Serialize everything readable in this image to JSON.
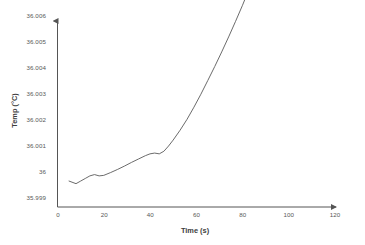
{
  "chart_data": {
    "type": "line",
    "title": "",
    "xlabel": "Time (s)",
    "ylabel": "Temp (°C)",
    "xlim": [
      0,
      120
    ],
    "ylim": [
      35.999,
      36.006
    ],
    "grid": false,
    "legend": null,
    "xticks": [
      "0",
      "20",
      "40",
      "60",
      "80",
      "100",
      "120"
    ],
    "xtick_values": [
      0,
      20,
      40,
      60,
      80,
      100,
      120
    ],
    "yticks": [
      "35.999",
      "36",
      "36.001",
      "36.002",
      "36.003",
      "36.004",
      "36.005",
      "36.006"
    ],
    "ytick_values": [
      35.999,
      36.0,
      36.001,
      36.002,
      36.003,
      36.004,
      36.005,
      36.006
    ],
    "series": [
      {
        "name": "Temp",
        "color": "#5a5a5a",
        "x": [
          5,
          8,
          10,
          12,
          14,
          16,
          18,
          20,
          23,
          26,
          29,
          32,
          35,
          38,
          40,
          42,
          44,
          46,
          48,
          50,
          53,
          56,
          59,
          62,
          65,
          68,
          71,
          74,
          77,
          80,
          83,
          86,
          89,
          92,
          95,
          98,
          100
        ],
        "y": [
          36.0,
          35.9999,
          36.0,
          36.0001,
          36.0002,
          36.00025,
          36.0002,
          36.00022,
          36.00033,
          36.00045,
          36.00058,
          36.00072,
          36.00085,
          36.00098,
          36.00105,
          36.00108,
          36.00105,
          36.00115,
          36.00135,
          36.00158,
          36.00196,
          36.00238,
          36.00285,
          36.00335,
          36.00388,
          36.00442,
          36.00498,
          36.00556,
          36.00616,
          36.00678,
          36.00744,
          36.00815,
          36.0089,
          36.00972,
          36.01058,
          36.01148,
          36.0121
        ]
      }
    ],
    "axis_arrows": true,
    "axis_color": "#555555"
  },
  "axes": {
    "y_title": "Temp (°C)",
    "x_title": "Time (s)",
    "y_tick_labels": [
      "36.006",
      "36.005",
      "36.004",
      "36.003",
      "36.002",
      "36.001",
      "36",
      "35.999"
    ],
    "x_tick_labels": [
      "0",
      "20",
      "40",
      "60",
      "80",
      "100",
      "120"
    ]
  }
}
